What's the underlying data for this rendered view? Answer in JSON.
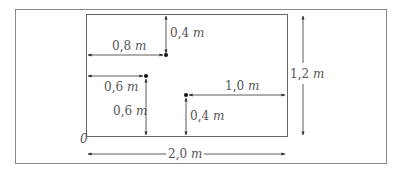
{
  "diagram": {
    "type": "dimensioned floor plan with points",
    "origin_label": "0",
    "rectangle": {
      "width_label": "2,0 m",
      "height_label": "1,2 m",
      "width_m": 2.0,
      "height_m": 1.2
    },
    "points": [
      {
        "id": "P1",
        "from_left_label": "0,8 m",
        "from_top_label": "0,4 m",
        "x_m": 0.8,
        "y_m": 0.8
      },
      {
        "id": "P2",
        "from_left_label": "0,6 m",
        "from_bottom_label": "0,6 m",
        "x_m": 0.6,
        "y_m": 0.6
      },
      {
        "id": "P3",
        "from_right_label": "1,0 m",
        "from_bottom_label": "0,4 m",
        "x_m": 1.0,
        "y_m": 0.4
      }
    ],
    "labels": {
      "p1_horizontal": {
        "num": "0,8",
        "unit": "m"
      },
      "p1_vertical": {
        "num": "0,4",
        "unit": "m"
      },
      "p2_horizontal": {
        "num": "0,6",
        "unit": "m"
      },
      "p2_vertical": {
        "num": "0,6",
        "unit": "m"
      },
      "p3_horizontal": {
        "num": "1,0",
        "unit": "m"
      },
      "p3_vertical": {
        "num": "0,4",
        "unit": "m"
      },
      "total_height": {
        "num": "1,2",
        "unit": "m"
      },
      "total_width": {
        "num": "2,0",
        "unit": "m"
      },
      "origin": "0"
    },
    "colors": {
      "line": "#666666",
      "arrow": "#333333",
      "point": "#111111",
      "text": "#555555"
    }
  }
}
